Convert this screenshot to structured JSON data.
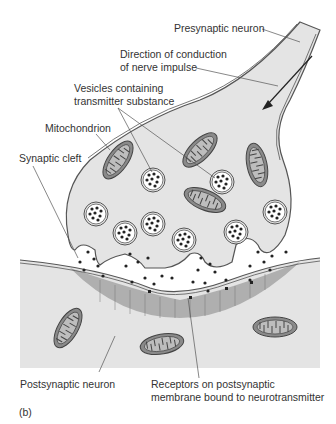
{
  "figure": {
    "panel_label": "(b)",
    "labels": {
      "presynaptic_neuron": "Presynaptic neuron",
      "direction_line1": "Direction of conduction",
      "direction_line2": "of nerve impulse",
      "vesicles_line1": "Vesicles containing",
      "vesicles_line2": "transmitter substance",
      "mitochondrion": "Mitochondrion",
      "synaptic_cleft": "Synaptic cleft",
      "postsynaptic_neuron": "Postsynaptic neuron",
      "receptors_line1": "Receptors on postsynaptic",
      "receptors_line2": "membrane bound to neurotransmitter"
    },
    "colors": {
      "cytoplasm": "#e4e4e4",
      "outline": "#555555",
      "mitochondrion_fill": "#8a8a8a",
      "receptor_band": "#a9a9a9",
      "vesicle_fill": "#ffffff",
      "dots": "#222222",
      "text": "#333333"
    }
  }
}
